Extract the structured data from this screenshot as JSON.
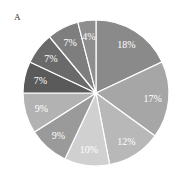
{
  "panel_label": "A",
  "chart_data": {
    "type": "pie",
    "title": "",
    "start_angle": "top",
    "direction": "clockwise",
    "slices": [
      {
        "label": "18%",
        "value": 18,
        "color": "#8a8a8a"
      },
      {
        "label": "17%",
        "value": 17,
        "color": "#a6a6a6"
      },
      {
        "label": "12%",
        "value": 12,
        "color": "#b8b8b8"
      },
      {
        "label": "10%",
        "value": 10,
        "color": "#d0d0d0"
      },
      {
        "label": "9%",
        "value": 9,
        "color": "#9a9a9a"
      },
      {
        "label": "9%",
        "value": 9,
        "color": "#b2b2b2"
      },
      {
        "label": "7%",
        "value": 7,
        "color": "#5a5a5a"
      },
      {
        "label": "7%",
        "value": 7,
        "color": "#6a6a6a"
      },
      {
        "label": "7%",
        "value": 7,
        "color": "#7e7e7e"
      },
      {
        "label": "4%",
        "value": 4,
        "color": "#8e8e8e"
      }
    ]
  }
}
